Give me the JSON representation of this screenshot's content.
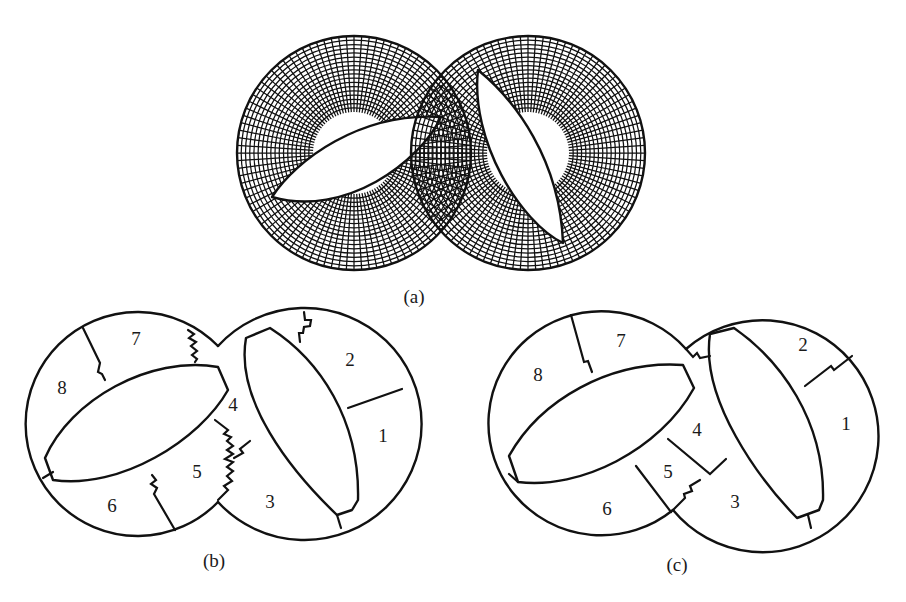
{
  "figure": {
    "panels": [
      {
        "id": "a",
        "caption": "(a)",
        "description": "Structured polar mesh on two overlapping circular rings, each with a lens-shaped hole",
        "geometry": {
          "left_circle": {
            "cx": 354,
            "cy": 153,
            "r": 117
          },
          "right_circle": {
            "cx": 528,
            "cy": 153,
            "r": 117
          },
          "left_hole_lens": {
            "from": [
              272,
              197
            ],
            "to": [
              441,
              117
            ],
            "tilt": "rising to the right"
          },
          "right_hole_lens": {
            "from": [
              478,
              70
            ],
            "to": [
              563,
              243
            ],
            "tilt": "falling to the right"
          }
        },
        "mesh": {
          "radial_divisions": 96,
          "ring_divisions": 9,
          "color": "#111111"
        }
      },
      {
        "id": "b",
        "caption": "(b)",
        "description": "Domain decomposition into 8 subdomains with jagged (staircase) interfaces",
        "subdomains": [
          {
            "label": "1",
            "x": 383,
            "y": 436
          },
          {
            "label": "2",
            "x": 350,
            "y": 366
          },
          {
            "label": "3",
            "x": 270,
            "y": 508
          },
          {
            "label": "4",
            "x": 233,
            "y": 411
          },
          {
            "label": "5",
            "x": 197,
            "y": 478
          },
          {
            "label": "6",
            "x": 112,
            "y": 512
          },
          {
            "label": "7",
            "x": 136,
            "y": 345
          },
          {
            "label": "8",
            "x": 62,
            "y": 394
          }
        ]
      },
      {
        "id": "c",
        "caption": "(c)",
        "description": "Same 8-subdomain decomposition with smoothed interfaces",
        "subdomains": [
          {
            "label": "1",
            "x": 846,
            "y": 430
          },
          {
            "label": "2",
            "x": 803,
            "y": 351
          },
          {
            "label": "3",
            "x": 735,
            "y": 508
          },
          {
            "label": "4",
            "x": 697,
            "y": 436
          },
          {
            "label": "5",
            "x": 668,
            "y": 473
          },
          {
            "label": "6",
            "x": 607,
            "y": 513
          },
          {
            "label": "7",
            "x": 621,
            "y": 347
          },
          {
            "label": "8",
            "x": 538,
            "y": 381
          }
        ]
      }
    ]
  }
}
